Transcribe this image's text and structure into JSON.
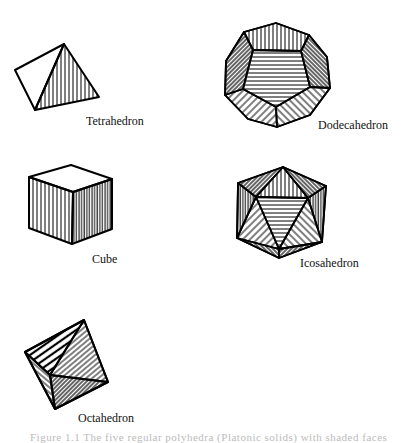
{
  "figure": {
    "solids": [
      {
        "name": "tetrahedron",
        "label": "Tetrahedron"
      },
      {
        "name": "dodecahedron",
        "label": "Dodecahedron"
      },
      {
        "name": "cube",
        "label": "Cube"
      },
      {
        "name": "icosahedron",
        "label": "Icosahedron"
      },
      {
        "name": "octahedron",
        "label": "Octahedron"
      }
    ],
    "caption": "Figure 1.1   The five regular polyhedra (Platonic solids) with shaded faces",
    "stroke_color": "#000000",
    "background_color": "#ffffff"
  }
}
